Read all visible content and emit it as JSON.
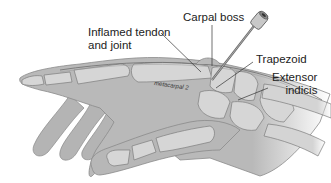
{
  "figure": {
    "labels": {
      "inflamed": "Inflamed tendon\nand joint",
      "inflamed_line1": "Inflamed tendon",
      "inflamed_line2": "and joint",
      "carpal_boss": "Carpal boss",
      "trapezoid": "Trapezoid",
      "extensor_line1": "Extensor",
      "extensor_line2": "indicis",
      "metacarpal": "metacarpal 2"
    },
    "colors": {
      "skin": "#b9b9b9",
      "bone": "#d4d4d4",
      "outline": "#7d7d7d",
      "text": "#222222",
      "needle": "#8a8a8a"
    }
  }
}
